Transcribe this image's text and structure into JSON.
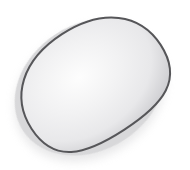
{
  "canvas": {
    "width": 190,
    "height": 170,
    "background_color": "#ffffff",
    "title": "speckled egg illustration"
  },
  "illustration": {
    "subject": "egg",
    "style": "clip-art",
    "description": "Tilted speckled egg with soft drop shadow",
    "outline": {
      "color": "#565659",
      "width": 2.0
    },
    "shadow": {
      "color": "#b9b9bc",
      "opacity": 0.55,
      "blur": 7,
      "offset_x": -3,
      "offset_y": 5
    },
    "body_gradient": {
      "type": "radial",
      "highlight_color": "#fdfdfd",
      "mid_color": "#e8e8ea",
      "edge_color": "#c2c2c6",
      "highlight_cx_pct": 44,
      "highlight_cy_pct": 40
    },
    "shape": {
      "rotation_deg": -33,
      "center_x": 93,
      "center_y": 82,
      "radius_x": 77,
      "radius_y": 57,
      "taper": 0.38
    },
    "spots": {
      "color": "#c9c9cd",
      "opacity": 0.6,
      "count": 10,
      "items": [
        {
          "cx": 50,
          "cy": 40,
          "r": 11
        },
        {
          "cx": 88,
          "cy": 31,
          "r": 10
        },
        {
          "cx": 124,
          "cy": 47,
          "r": 10
        },
        {
          "cx": 152,
          "cy": 63,
          "r": 10
        },
        {
          "cx": 46,
          "cy": 70,
          "r": 11
        },
        {
          "cx": 103,
          "cy": 85,
          "r": 11
        },
        {
          "cx": 59,
          "cy": 108,
          "r": 9
        },
        {
          "cx": 108,
          "cy": 128,
          "r": 11
        },
        {
          "cx": 153,
          "cy": 115,
          "r": 10
        },
        {
          "cx": 88,
          "cy": 62,
          "r": 8
        }
      ]
    }
  }
}
